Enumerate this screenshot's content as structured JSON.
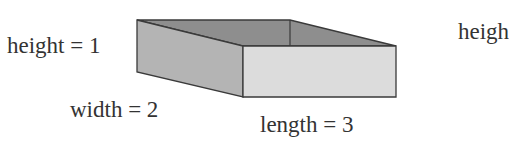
{
  "diagram": {
    "type": "rectangular-box",
    "labels": {
      "height": "height = 1",
      "width": "width = 2",
      "length": "length = 3",
      "cut_off": "heigh"
    },
    "colors": {
      "top_face": "#8e8e8e",
      "left_face": "#b4b4b4",
      "front_face": "#dcdcdc",
      "edge": "#3a3a3a"
    }
  }
}
